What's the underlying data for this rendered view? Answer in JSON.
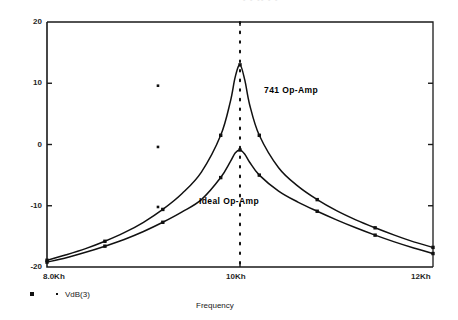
{
  "ghost_header": "- - --  - -",
  "axes": {
    "y_ticks": [
      "20",
      "10",
      "0",
      "-10",
      "-20"
    ],
    "y_values": [
      20,
      10,
      0,
      -10,
      -20
    ],
    "x_ticks": [
      "8.0Kh",
      "10Kh",
      "12Kh"
    ],
    "x_values": [
      8.0,
      10.0,
      12.0
    ],
    "x_title": "Frequency"
  },
  "annotations": {
    "curve_741": "741 Op-Amp",
    "curve_ideal": "Ideal Op-Amp"
  },
  "legend": {
    "trace_label": "VdB(3)",
    "square_marker": "square-marker",
    "dot_marker": "dot-marker"
  },
  "cursor": {
    "x_khz": 10.0,
    "style": "dotted-vertical"
  },
  "colors": {
    "axis": "#1a1a1a",
    "curve": "#111111",
    "cursor": "#111111",
    "background": "#ffffff"
  },
  "chart_data": {
    "type": "line",
    "title": "",
    "subtitle": "",
    "xlabel": "Frequency",
    "ylabel": "",
    "xlim": [
      8.0,
      12.0
    ],
    "ylim": [
      -20,
      20
    ],
    "x_unit": "kHz",
    "y_unit": "dB",
    "grid": false,
    "legend_position": "bottom-left",
    "x": [
      8.0,
      8.2,
      8.4,
      8.6,
      8.8,
      9.0,
      9.2,
      9.4,
      9.6,
      9.8,
      9.9,
      9.95,
      10.0,
      10.05,
      10.1,
      10.2,
      10.4,
      10.6,
      10.8,
      11.0,
      11.2,
      11.4,
      11.6,
      11.8,
      12.0
    ],
    "series": [
      {
        "name": "741 Op-Amp",
        "marker": "square",
        "values": [
          -18.9,
          -18.0,
          -17.0,
          -15.8,
          -14.4,
          -12.7,
          -10.6,
          -8.0,
          -4.5,
          1.5,
          7.0,
          11.0,
          13.0,
          10.5,
          6.5,
          1.5,
          -3.8,
          -6.8,
          -9.0,
          -10.8,
          -12.3,
          -13.6,
          -14.8,
          -15.9,
          -16.8
        ]
      },
      {
        "name": "Ideal Op-Amp",
        "marker": "square",
        "values": [
          -19.2,
          -18.5,
          -17.6,
          -16.6,
          -15.5,
          -14.2,
          -12.7,
          -11.0,
          -9.0,
          -5.4,
          -2.8,
          -1.4,
          -0.9,
          -1.6,
          -2.9,
          -5.0,
          -7.6,
          -9.4,
          -10.9,
          -12.3,
          -13.6,
          -14.8,
          -15.9,
          -16.9,
          -17.8
        ]
      }
    ],
    "stray_points": [
      {
        "x": 9.15,
        "y": 9.6
      },
      {
        "x": 9.15,
        "y": -0.4
      },
      {
        "x": 9.15,
        "y": -10.2
      }
    ],
    "cursor_line_x": 10.0
  }
}
